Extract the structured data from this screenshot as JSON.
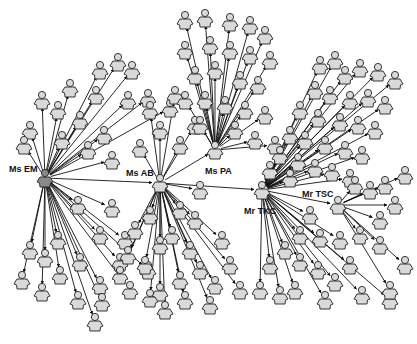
{
  "diagram": {
    "type": "network",
    "width": 417,
    "height": 344,
    "colors": {
      "background": "#ffffff",
      "node_fill": "#d9d9d9",
      "hub_fill_dark": "#8a8a8a",
      "node_stroke": "#222222",
      "edge": "#111111"
    },
    "hubs": [
      {
        "id": "EM",
        "label": "Ms EM",
        "x": 45,
        "y": 178,
        "dark": true,
        "label_dx": -36,
        "label_dy": -6
      },
      {
        "id": "AB",
        "label": "Ms AB",
        "x": 160,
        "y": 183,
        "dark": false,
        "label_dx": -34,
        "label_dy": -7
      },
      {
        "id": "PA",
        "label": "Ms PA",
        "x": 215,
        "y": 150,
        "dark": false,
        "label_dx": -10,
        "label_dy": 24
      },
      {
        "id": "TKC",
        "label": "Mr TKC",
        "x": 262,
        "y": 190,
        "dark": false,
        "label_dx": -18,
        "label_dy": 24
      },
      {
        "id": "TSC",
        "label": "Mr TSC",
        "x": 338,
        "y": 205,
        "dark": false,
        "label_dx": -36,
        "label_dy": -8
      }
    ],
    "hub_edges": [
      [
        "EM",
        "AB"
      ],
      [
        "AB",
        "PA"
      ],
      [
        "AB",
        "TKC"
      ],
      [
        "TKC",
        "TSC"
      ]
    ],
    "clusters": [
      {
        "hub": "EM",
        "nodes": [
          [
            30,
            130
          ],
          [
            42,
            100
          ],
          [
            58,
            110
          ],
          [
            70,
            88
          ],
          [
            80,
            120
          ],
          [
            96,
            95
          ],
          [
            100,
            70
          ],
          [
            118,
            62
          ],
          [
            132,
            70
          ],
          [
            128,
            100
          ],
          [
            148,
            98
          ],
          [
            104,
            135
          ],
          [
            88,
            150
          ],
          [
            112,
            160
          ],
          [
            62,
            140
          ],
          [
            24,
            145
          ],
          [
            170,
            108
          ],
          [
            78,
            205
          ],
          [
            112,
            208
          ],
          [
            100,
            235
          ],
          [
            125,
            240
          ],
          [
            30,
            250
          ],
          [
            45,
            258
          ],
          [
            58,
            240
          ],
          [
            22,
            280
          ],
          [
            42,
            292
          ],
          [
            60,
            275
          ],
          [
            80,
            262
          ],
          [
            78,
            300
          ],
          [
            100,
            285
          ],
          [
            95,
            322
          ],
          [
            102,
            302
          ],
          [
            120,
            262
          ],
          [
            130,
            290
          ],
          [
            148,
            270
          ]
        ]
      },
      {
        "hub": "AB",
        "nodes": [
          [
            140,
            148
          ],
          [
            160,
            130
          ],
          [
            180,
            145
          ],
          [
            150,
            110
          ],
          [
            195,
            125
          ],
          [
            175,
            95
          ],
          [
            200,
            190
          ],
          [
            180,
            210
          ],
          [
            195,
            220
          ],
          [
            150,
            215
          ],
          [
            135,
            230
          ],
          [
            160,
            245
          ],
          [
            172,
            235
          ],
          [
            190,
            250
          ],
          [
            200,
            270
          ],
          [
            215,
            285
          ],
          [
            180,
            280
          ],
          [
            160,
            292
          ],
          [
            145,
            265
          ],
          [
            128,
            255
          ],
          [
            222,
            240
          ],
          [
            230,
            265
          ],
          [
            240,
            290
          ],
          [
            210,
            305
          ],
          [
            185,
            300
          ],
          [
            165,
            310
          ],
          [
            150,
            298
          ],
          [
            120,
            275
          ]
        ]
      },
      {
        "hub": "PA",
        "nodes": [
          [
            185,
            20
          ],
          [
            205,
            18
          ],
          [
            230,
            22
          ],
          [
            250,
            25
          ],
          [
            265,
            35
          ],
          [
            185,
            50
          ],
          [
            210,
            45
          ],
          [
            230,
            50
          ],
          [
            250,
            55
          ],
          [
            270,
            60
          ],
          [
            195,
            75
          ],
          [
            215,
            70
          ],
          [
            240,
            80
          ],
          [
            258,
            85
          ],
          [
            185,
            100
          ],
          [
            205,
            100
          ],
          [
            225,
            105
          ],
          [
            245,
            110
          ],
          [
            265,
            115
          ],
          [
            200,
            125
          ],
          [
            235,
            130
          ],
          [
            255,
            140
          ],
          [
            275,
            145
          ]
        ]
      },
      {
        "hub": "TKC",
        "nodes": [
          [
            320,
            65
          ],
          [
            335,
            60
          ],
          [
            345,
            75
          ],
          [
            360,
            68
          ],
          [
            378,
            72
          ],
          [
            395,
            80
          ],
          [
            315,
            90
          ],
          [
            330,
            95
          ],
          [
            350,
            100
          ],
          [
            368,
            98
          ],
          [
            385,
            105
          ],
          [
            300,
            110
          ],
          [
            318,
            118
          ],
          [
            340,
            122
          ],
          [
            358,
            125
          ],
          [
            375,
            130
          ],
          [
            290,
            135
          ],
          [
            305,
            140
          ],
          [
            325,
            145
          ],
          [
            345,
            150
          ],
          [
            362,
            155
          ],
          [
            280,
            155
          ],
          [
            298,
            162
          ],
          [
            315,
            168
          ],
          [
            332,
            172
          ],
          [
            350,
            178
          ],
          [
            270,
            170
          ],
          [
            290,
            178
          ],
          [
            310,
            215
          ],
          [
            300,
            235
          ],
          [
            285,
            250
          ],
          [
            300,
            262
          ],
          [
            270,
            265
          ],
          [
            260,
            290
          ],
          [
            280,
            295
          ],
          [
            295,
            290
          ],
          [
            318,
            270
          ],
          [
            325,
            300
          ],
          [
            335,
            282
          ],
          [
            350,
            265
          ],
          [
            362,
            295
          ],
          [
            390,
            300
          ],
          [
            340,
            240
          ],
          [
            320,
            238
          ]
        ]
      },
      {
        "hub": "TSC",
        "nodes": [
          [
            355,
            185
          ],
          [
            370,
            190
          ],
          [
            385,
            185
          ],
          [
            405,
            175
          ],
          [
            395,
            205
          ],
          [
            380,
            220
          ],
          [
            360,
            235
          ],
          [
            380,
            245
          ],
          [
            405,
            265
          ],
          [
            390,
            290
          ]
        ]
      }
    ]
  }
}
